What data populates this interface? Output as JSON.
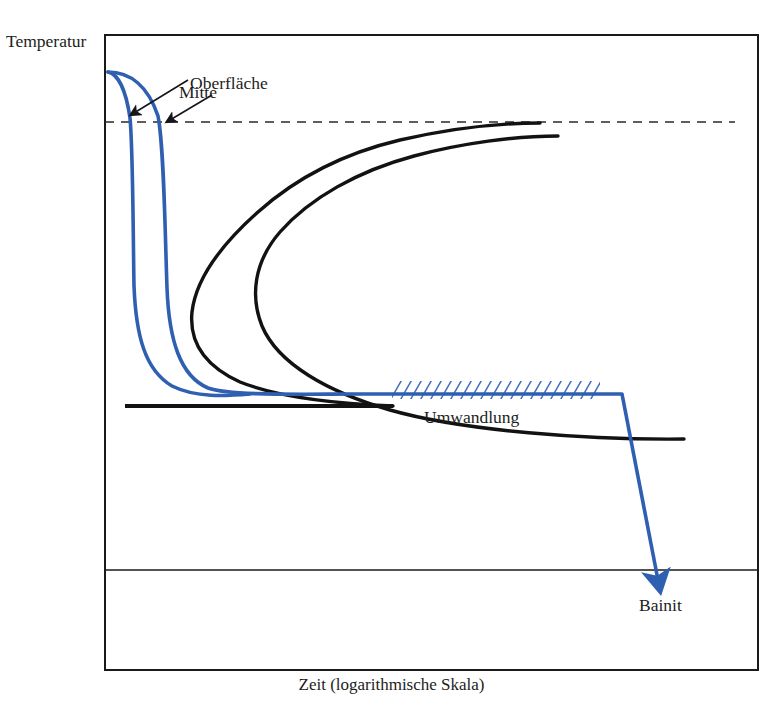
{
  "figure": {
    "kind": "technical-line-diagram"
  },
  "axes": {
    "y_label": "Temperatur",
    "x_label": "Zeit (logarithmische Skala)"
  },
  "annotations": {
    "surface": "Oberfläche",
    "centre": "Mitte",
    "transformation": "Umwandlung",
    "product": "Bainit"
  },
  "colors": {
    "cooling_curve": "#2f5fb0",
    "ttt_curve": "#121212",
    "frame": "#1a1a1a",
    "hatch": "#3f6fbe",
    "background": "#ffffff"
  },
  "chart_data": {
    "type": "line",
    "title": "",
    "xlabel": "Zeit (logarithmische Skala)",
    "ylabel": "Temperatur",
    "xlim": [
      105,
      758
    ],
    "ylim": [
      670,
      35
    ],
    "grid": false,
    "legend": "none",
    "annotations": [
      {
        "text": "Oberfläche",
        "x": 190,
        "y": 75,
        "arrow_to": [
          131,
          112
        ]
      },
      {
        "text": "Mitte",
        "x": 179,
        "y": 84,
        "arrow_to": [
          166,
          122
        ]
      },
      {
        "text": "Umwandlung",
        "x": 424,
        "y": 409,
        "arrow_to": null
      },
      {
        "text": "Bainit",
        "x": 639,
        "y": 597,
        "arrow_to": null
      }
    ],
    "series": [
      {
        "name": "Haltelinie (gestrichelt)",
        "style": "dashed",
        "color": "#2a2a2a",
        "points": [
          [
            105,
            122
          ],
          [
            735,
            122
          ]
        ]
      },
      {
        "name": "Umwandlungsbeginn (TTT-Nase 1)",
        "style": "solid",
        "color": "#121212",
        "points": [
          [
            540,
            123
          ],
          [
            470,
            126
          ],
          [
            400,
            136
          ],
          [
            330,
            158
          ],
          [
            265,
            190
          ],
          [
            215,
            232
          ],
          [
            193,
            276
          ],
          [
            188,
            316
          ],
          [
            200,
            346
          ],
          [
            240,
            372
          ],
          [
            300,
            391
          ],
          [
            360,
            400
          ],
          [
            393,
            406
          ]
        ]
      },
      {
        "name": "Umwandlungsende (TTT-Nase 2)",
        "style": "solid",
        "color": "#121212",
        "points": [
          [
            558,
            136
          ],
          [
            492,
            140
          ],
          [
            420,
            152
          ],
          [
            352,
            176
          ],
          [
            300,
            208
          ],
          [
            268,
            246
          ],
          [
            262,
            286
          ],
          [
            278,
            324
          ],
          [
            320,
            362
          ],
          [
            380,
            396
          ],
          [
            450,
            412
          ],
          [
            520,
            425
          ],
          [
            600,
            436
          ],
          [
            680,
            440
          ]
        ]
      },
      {
        "name": "Mf-Linie",
        "style": "solid",
        "color": "#121212",
        "points": [
          [
            125,
            406
          ],
          [
            393,
            406
          ]
        ]
      },
      {
        "name": "Ms-Linie (dünn)",
        "style": "solid-thin",
        "color": "#1a1a1a",
        "points": [
          [
            105,
            570
          ],
          [
            758,
            570
          ]
        ]
      },
      {
        "name": "Oberfläche (Abkühlkurve)",
        "style": "solid",
        "color": "#2f5fb0",
        "points": [
          [
            108,
            72
          ],
          [
            118,
            80
          ],
          [
            126,
            100
          ],
          [
            131,
            132
          ],
          [
            133,
            190
          ],
          [
            134,
            260
          ],
          [
            137,
            320
          ],
          [
            146,
            362
          ],
          [
            165,
            384
          ],
          [
            196,
            392
          ],
          [
            250,
            394
          ]
        ]
      },
      {
        "name": "Mitte (Abkühlkurve)",
        "style": "solid",
        "color": "#2f5fb0",
        "points": [
          [
            108,
            72
          ],
          [
            134,
            76
          ],
          [
            152,
            92
          ],
          [
            163,
            124
          ],
          [
            166,
            188
          ],
          [
            167,
            262
          ],
          [
            170,
            322
          ],
          [
            182,
            368
          ],
          [
            205,
            388
          ],
          [
            250,
            394
          ],
          [
            400,
            394
          ],
          [
            560,
            394
          ],
          [
            622,
            394
          ]
        ]
      },
      {
        "name": "Abschreckung zu Bainit",
        "style": "arrow",
        "color": "#2f5fb0",
        "points": [
          [
            622,
            394
          ],
          [
            634,
            470
          ],
          [
            652,
            560
          ],
          [
            660,
            592
          ]
        ]
      }
    ],
    "hatched_band": {
      "label": "Umwandlung",
      "x_start": 392,
      "x_end": 600,
      "y_top": 381,
      "y_bottom": 399,
      "color": "#3f6fbe"
    }
  }
}
